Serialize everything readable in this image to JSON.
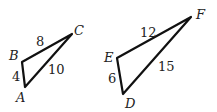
{
  "diagram": {
    "triangles": [
      {
        "name": "ABC",
        "vertices": {
          "A": [
            25,
            87
          ],
          "B": [
            22,
            62
          ],
          "C": [
            72,
            34
          ]
        },
        "sides": {
          "AB": "4",
          "BC": "8",
          "AC": "10"
        }
      },
      {
        "name": "DEF",
        "vertices": {
          "D": [
            123,
            94
          ],
          "E": [
            117,
            58
          ],
          "F": [
            191,
            17
          ]
        },
        "sides": {
          "DE": "6",
          "EF": "12",
          "DF": "15"
        }
      }
    ],
    "labels": {
      "A": "A",
      "B": "B",
      "C": "C",
      "D": "D",
      "E": "E",
      "F": "F",
      "ab": "4",
      "bc": "8",
      "ac": "10",
      "de": "6",
      "ef": "12",
      "df": "15"
    },
    "stroke_color": "#111111"
  }
}
